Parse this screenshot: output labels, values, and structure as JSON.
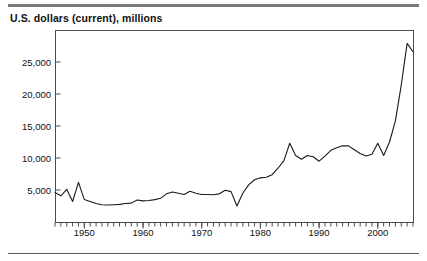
{
  "figure": {
    "title": "U.S. dollars (current), millions",
    "rule_color": "#7a7a7a",
    "line_color": "#1a1a1a",
    "frame_color": "#4d4d4d",
    "background": "#ffffff"
  },
  "chart_data": {
    "type": "line",
    "title": "U.S. dollars (current), millions",
    "xlabel": "",
    "ylabel": "U.S. dollars (current), millions",
    "xlim": [
      1945,
      2006
    ],
    "ylim": [
      0,
      30000
    ],
    "grid": false,
    "legend": null,
    "y_ticks": [
      5000,
      10000,
      15000,
      20000,
      25000
    ],
    "y_tick_labels": [
      "5,000",
      "10,000",
      "15,000",
      "20,000",
      "25,000"
    ],
    "x_ticks": [
      1950,
      1960,
      1970,
      1980,
      1990,
      2000
    ],
    "x_tick_labels": [
      "1950",
      "1960",
      "1970",
      "1980",
      "1990",
      "2000"
    ],
    "x_minor_tick_interval": 1,
    "series": [
      {
        "name": "U.S. dollars (current), millions",
        "x": [
          1945,
          1946,
          1947,
          1948,
          1949,
          1950,
          1951,
          1952,
          1953,
          1954,
          1955,
          1956,
          1957,
          1958,
          1959,
          1960,
          1961,
          1962,
          1963,
          1964,
          1965,
          1966,
          1967,
          1968,
          1969,
          1970,
          1971,
          1972,
          1973,
          1974,
          1975,
          1976,
          1977,
          1978,
          1979,
          1980,
          1981,
          1982,
          1983,
          1984,
          1985,
          1986,
          1987,
          1988,
          1989,
          1990,
          1991,
          1992,
          1993,
          1994,
          1995,
          1996,
          1997,
          1998,
          1999,
          2000,
          2001,
          2002,
          2003,
          2004,
          2005,
          2006
        ],
        "values": [
          4600,
          4100,
          5100,
          3200,
          6200,
          3500,
          3200,
          2900,
          2700,
          2650,
          2700,
          2750,
          2900,
          2950,
          3450,
          3300,
          3350,
          3500,
          3700,
          4400,
          4700,
          4500,
          4300,
          4800,
          4500,
          4300,
          4300,
          4250,
          4400,
          4950,
          4750,
          2500,
          4500,
          5800,
          6600,
          6900,
          7000,
          7400,
          8400,
          9600,
          12300,
          10400,
          9800,
          10400,
          10200,
          9500,
          10300,
          11200,
          11600,
          11900,
          11900,
          11300,
          10700,
          10300,
          10600,
          12300,
          10400,
          12500,
          15800,
          21400,
          27900,
          26600
        ]
      }
    ]
  },
  "icons": {
    "chart_line": "line-chart-icon"
  }
}
